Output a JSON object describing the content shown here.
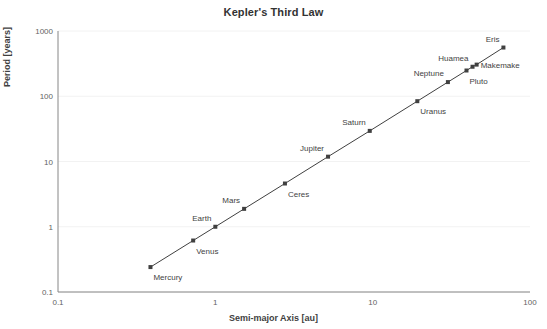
{
  "chart_data": {
    "type": "scatter",
    "title": "Kepler's Third Law",
    "xlabel": "Semi-major Axis [au]",
    "ylabel": "Period [years]",
    "xscale": "log",
    "yscale": "log",
    "xlim": [
      0.1,
      100
    ],
    "ylim": [
      0.1,
      1000
    ],
    "xticks": [
      "0.1",
      "1",
      "10",
      "100"
    ],
    "xtick_values": [
      0.1,
      1,
      10,
      100
    ],
    "yticks": [
      "0.1",
      "1",
      "10",
      "100",
      "1000"
    ],
    "ytick_values": [
      0.1,
      1,
      10,
      100,
      1000
    ],
    "grid": true,
    "grid_axis": "y",
    "legend": false,
    "marker": "square",
    "line": "connected",
    "series_color": "#404040",
    "grid_color": "#f2f2f2",
    "points": [
      {
        "label": "Mercury",
        "x": 0.387,
        "y": 0.241,
        "label_pos": "below-right"
      },
      {
        "label": "Venus",
        "x": 0.723,
        "y": 0.615,
        "label_pos": "below-right"
      },
      {
        "label": "Earth",
        "x": 1.0,
        "y": 1.0,
        "label_pos": "above-left"
      },
      {
        "label": "Mars",
        "x": 1.524,
        "y": 1.881,
        "label_pos": "above-left"
      },
      {
        "label": "Ceres",
        "x": 2.77,
        "y": 4.6,
        "label_pos": "below-right"
      },
      {
        "label": "Jupiter",
        "x": 5.204,
        "y": 11.86,
        "label_pos": "above-left"
      },
      {
        "label": "Saturn",
        "x": 9.583,
        "y": 29.46,
        "label_pos": "above-left"
      },
      {
        "label": "Uranus",
        "x": 19.22,
        "y": 84.01,
        "label_pos": "below-right"
      },
      {
        "label": "Neptune",
        "x": 30.07,
        "y": 164.8,
        "label_pos": "above-left"
      },
      {
        "label": "Pluto",
        "x": 39.48,
        "y": 248.0,
        "label_pos": "below-right"
      },
      {
        "label": "Huamea",
        "x": 43.13,
        "y": 283.3,
        "label_pos": "above-left"
      },
      {
        "label": "Makemake",
        "x": 45.79,
        "y": 305.3,
        "label_pos": "right"
      },
      {
        "label": "Eris",
        "x": 67.78,
        "y": 558.0,
        "label_pos": "above-left"
      }
    ]
  }
}
